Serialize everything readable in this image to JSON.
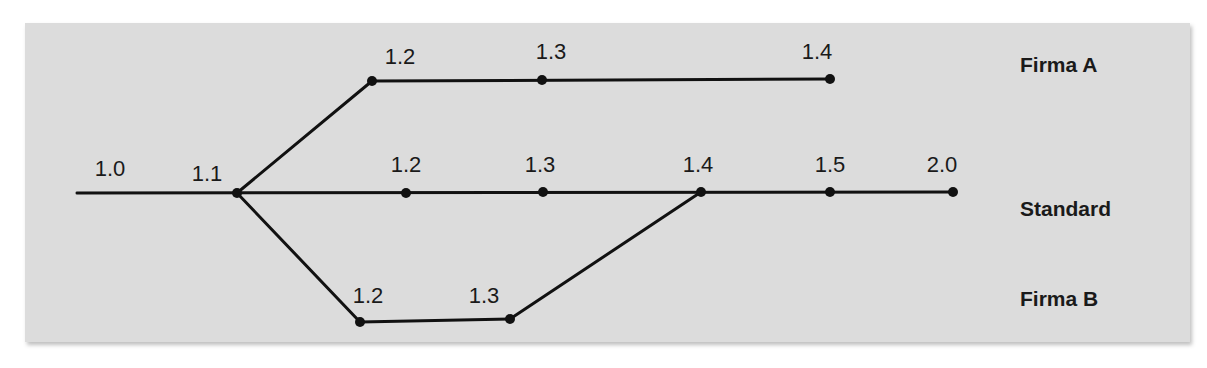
{
  "diagram": {
    "type": "version-branch-tree",
    "branches": [
      {
        "id": "firma_a",
        "label": "Firma A"
      },
      {
        "id": "standard",
        "label": "Standard"
      },
      {
        "id": "firma_b",
        "label": "Firma B"
      }
    ],
    "labels": {
      "firma_a": "Firma A",
      "standard": "Standard",
      "firma_b": "Firma B"
    },
    "nodes": {
      "std_1_0": {
        "version": "1.0",
        "branch": "standard"
      },
      "std_1_1": {
        "version": "1.1",
        "branch": "standard"
      },
      "std_1_2": {
        "version": "1.2",
        "branch": "standard"
      },
      "std_1_3": {
        "version": "1.3",
        "branch": "standard"
      },
      "std_1_4": {
        "version": "1.4",
        "branch": "standard"
      },
      "std_1_5": {
        "version": "1.5",
        "branch": "standard"
      },
      "std_2_0": {
        "version": "2.0",
        "branch": "standard"
      },
      "a_1_2": {
        "version": "1.2",
        "branch": "firma_a"
      },
      "a_1_3": {
        "version": "1.3",
        "branch": "firma_a"
      },
      "a_1_4": {
        "version": "1.4",
        "branch": "firma_a"
      },
      "b_1_2": {
        "version": "1.2",
        "branch": "firma_b"
      },
      "b_1_3": {
        "version": "1.3",
        "branch": "firma_b"
      }
    },
    "edges": [
      [
        "std_1_0",
        "std_1_1"
      ],
      [
        "std_1_1",
        "std_1_2"
      ],
      [
        "std_1_2",
        "std_1_3"
      ],
      [
        "std_1_3",
        "std_1_4"
      ],
      [
        "std_1_4",
        "std_1_5"
      ],
      [
        "std_1_5",
        "std_2_0"
      ],
      [
        "std_1_1",
        "a_1_2"
      ],
      [
        "a_1_2",
        "a_1_3"
      ],
      [
        "a_1_3",
        "a_1_4"
      ],
      [
        "std_1_1",
        "b_1_2"
      ],
      [
        "b_1_2",
        "b_1_3"
      ],
      [
        "b_1_3",
        "std_1_4"
      ]
    ],
    "colors": {
      "background": "#dcdcdc",
      "line": "#111111",
      "text": "#1a1a1a"
    }
  }
}
